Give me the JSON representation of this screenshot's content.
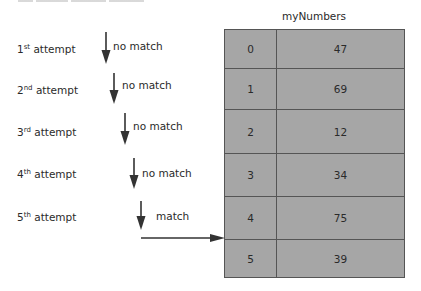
{
  "diagram": {
    "array_name": "myNumbers",
    "array": [
      {
        "index": "0",
        "value": "47"
      },
      {
        "index": "1",
        "value": "69"
      },
      {
        "index": "2",
        "value": "12"
      },
      {
        "index": "3",
        "value": "34"
      },
      {
        "index": "4",
        "value": "75"
      },
      {
        "index": "5",
        "value": "39"
      }
    ],
    "attempts": [
      {
        "num": "1",
        "suffix": "st",
        "word": " attempt",
        "result": "no match"
      },
      {
        "num": "2",
        "suffix": "nd",
        "word": " attempt",
        "result": "no match"
      },
      {
        "num": "3",
        "suffix": "rd",
        "word": " attempt",
        "result": "no match"
      },
      {
        "num": "4",
        "suffix": "th",
        "word": " attempt",
        "result": "no match"
      },
      {
        "num": "5",
        "suffix": "th",
        "word": " attempt",
        "result": "match"
      }
    ],
    "colors": {
      "cell_fill": "#a6a6a6",
      "border": "#555555",
      "arrow": "#333333"
    }
  }
}
